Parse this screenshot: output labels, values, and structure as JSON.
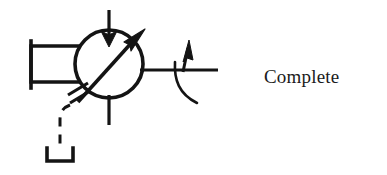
{
  "page": {
    "width": 387,
    "height": 175,
    "background_color": "#ffffff",
    "ink_color": "#141414"
  },
  "caption": {
    "text": "Complete"
  },
  "diagram": {
    "title": "Complete",
    "kind": "schematic-symbol",
    "stroke_color": "#141414",
    "fill_color": "none",
    "parts": [
      {
        "name": "central-circle",
        "shape": "circle",
        "cx": 109,
        "cy": 64,
        "r": 34,
        "stroke_width": 3.4
      },
      {
        "name": "left-rectangle",
        "shape": "rectangle",
        "x": 31,
        "y": 46,
        "width": 48,
        "height": 36,
        "stroke_width": 3.4
      },
      {
        "name": "left-end-bar",
        "shape": "vertical-line",
        "x": 31,
        "y1": 41,
        "y2": 88,
        "stroke_width": 3.4
      },
      {
        "name": "top-stem",
        "shape": "vertical-line",
        "x": 109,
        "y1": 10,
        "y2": 44,
        "stroke_width": 3.2
      },
      {
        "name": "top-arrowhead-down",
        "shape": "arrowhead",
        "direction": "down",
        "tip_x": 109,
        "tip_y": 46
      },
      {
        "name": "bottom-stem",
        "shape": "vertical-line",
        "x": 109,
        "y1": 94,
        "y2": 125,
        "stroke_width": 3.2
      },
      {
        "name": "diagonal-arrow-shaft",
        "shape": "line",
        "x1": 77,
        "y1": 101,
        "x2": 139,
        "y2": 35,
        "stroke_width": 3.4
      },
      {
        "name": "diagonal-arrowhead-up-right",
        "shape": "arrowhead",
        "direction": "up-right",
        "tip_x": 143,
        "tip_y": 31
      },
      {
        "name": "diagonal-arrow-fletching",
        "shape": "double-slash",
        "count": 2
      },
      {
        "name": "right-horizontal-line",
        "shape": "horizontal-line",
        "x1": 140,
        "y1": 70,
        "x2": 218,
        "stroke_width": 3.2
      },
      {
        "name": "right-arrowhead-up",
        "shape": "arrowhead",
        "direction": "up",
        "tip_x": 186,
        "tip_y": 41
      },
      {
        "name": "right-arc",
        "shape": "arc",
        "sweep": "down-right",
        "stroke_width": 2.6
      },
      {
        "name": "dashed-control-line",
        "shape": "dashed-polyline",
        "stroke_width": 3.0,
        "dash": "9 7"
      },
      {
        "name": "ground-bracket",
        "shape": "u-bracket",
        "x": 47,
        "y": 148,
        "width": 26,
        "height": 14,
        "stroke_width": 3.4
      }
    ]
  }
}
